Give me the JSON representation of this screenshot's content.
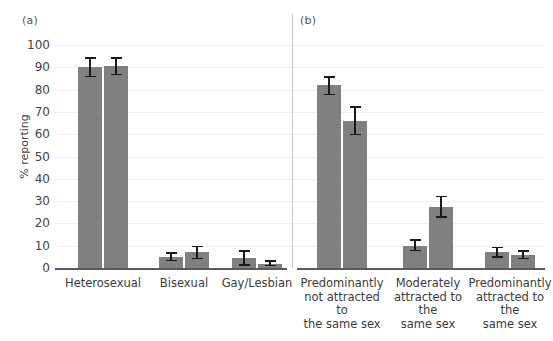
{
  "figure": {
    "width": 553,
    "height": 341,
    "background": "#ffffff",
    "bar_color": "#808080",
    "error_color": "#1a1a1a",
    "gridline_color": "#f1eeee",
    "axis_color": "#595959",
    "panel_a_tag": "(a)",
    "panel_b_tag": "(b)"
  },
  "chart_data": {
    "type": "bar",
    "title": "",
    "xlabel": "",
    "ylabel": "% reporting",
    "ylim": [
      0,
      100
    ],
    "yticks": [
      0,
      10,
      20,
      30,
      40,
      50,
      60,
      70,
      80,
      90,
      100
    ],
    "ytick_labels": [
      "0",
      "10",
      "20",
      "30",
      "40",
      "50",
      "60",
      "70",
      "80",
      "90",
      "100"
    ],
    "grid": "horizontal",
    "legend": "none",
    "panels": [
      {
        "tag": "(a)",
        "categories": [
          "Heterosexual",
          "Bisexual",
          "Gay/Lesbian"
        ],
        "series": [
          {
            "name": "bar-1",
            "values": [
              90.0,
              5.0,
              4.5
            ]
          },
          {
            "name": "bar-2",
            "values": [
              90.5,
              7.0,
              2.0
            ]
          }
        ],
        "error_low": [
          [
            85.5,
            3.0,
            1.0
          ],
          [
            86.5,
            4.0,
            0.8
          ]
        ],
        "error_high": [
          [
            94.5,
            7.0,
            8.0
          ],
          [
            94.5,
            10.0,
            3.5
          ]
        ]
      },
      {
        "tag": "(b)",
        "categories": [
          "Predominantly not attracted to the same sex",
          "Moderately attracted to the same sex",
          "Predominantly attracted to the same sex"
        ],
        "category_lines": [
          [
            "Predominantly",
            "not attracted to",
            "the same sex"
          ],
          [
            "Moderately",
            "attracted to the",
            "same sex"
          ],
          [
            "Predominantly",
            "attracted to the",
            "same sex"
          ]
        ],
        "series": [
          {
            "name": "bar-1",
            "values": [
              82.0,
              10.0,
              7.0
            ]
          },
          {
            "name": "bar-2",
            "values": [
              66.0,
              27.5,
              6.0
            ]
          }
        ],
        "error_low": [
          [
            77.5,
            7.5,
            4.5
          ],
          [
            59.5,
            22.5,
            4.0
          ]
        ],
        "error_high": [
          [
            86.0,
            13.0,
            9.5
          ],
          [
            72.5,
            32.5,
            8.0
          ]
        ]
      }
    ]
  }
}
